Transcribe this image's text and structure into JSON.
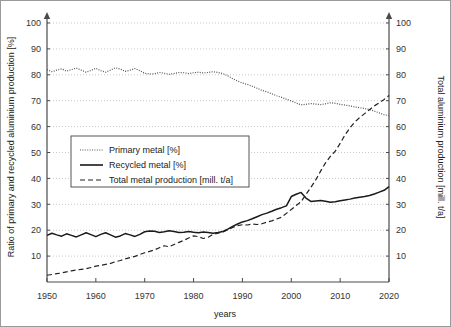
{
  "chart_data": {
    "type": "line",
    "title": "",
    "xlabel": "years",
    "ylabel_left": "Ratio of primary and recycled aluminium production [%]",
    "ylabel_right": "Total aluminium production [mill. t/a]",
    "xlim": [
      1950,
      2020
    ],
    "ylim_left": [
      0,
      100
    ],
    "ylim_right": [
      0,
      100
    ],
    "grid": true,
    "legend_position": "center-left",
    "xticks": [
      1950,
      1960,
      1970,
      1980,
      1990,
      2000,
      2010,
      2020
    ],
    "xtick_labels": [
      "1950",
      "1960",
      "1970",
      "1980",
      "1990",
      "2000",
      "2010",
      "2020"
    ],
    "yticks_left": [
      0,
      10,
      20,
      30,
      40,
      50,
      60,
      70,
      80,
      90,
      100
    ],
    "ytick_labels_left": [
      "",
      "10",
      "20",
      "30",
      "40",
      "50",
      "60",
      "70",
      "80",
      "90",
      "100"
    ],
    "yticks_right": [
      0,
      10,
      20,
      30,
      40,
      50,
      60,
      70,
      80,
      90,
      100
    ],
    "ytick_labels_right": [
      "",
      "10",
      "20",
      "30",
      "40",
      "50",
      "60",
      "70",
      "80",
      "90",
      "100"
    ],
    "x": [
      1950,
      1951,
      1952,
      1953,
      1954,
      1955,
      1956,
      1957,
      1958,
      1959,
      1960,
      1961,
      1962,
      1963,
      1964,
      1965,
      1966,
      1967,
      1968,
      1969,
      1970,
      1971,
      1972,
      1973,
      1974,
      1975,
      1976,
      1977,
      1978,
      1979,
      1980,
      1981,
      1982,
      1983,
      1984,
      1985,
      1986,
      1987,
      1988,
      1989,
      1990,
      1991,
      1992,
      1993,
      1994,
      1995,
      1996,
      1997,
      1998,
      1999,
      2000,
      2001,
      2002,
      2003,
      2004,
      2005,
      2006,
      2007,
      2008,
      2009,
      2010,
      2011,
      2012,
      2013,
      2014,
      2015,
      2016,
      2017,
      2018,
      2019,
      2020
    ],
    "series": [
      {
        "name": "Primary metal [%]",
        "axis": "left",
        "style": "dotted",
        "color": "#555555",
        "values": [
          82.0,
          81.2,
          81.8,
          82.3,
          81.4,
          82.0,
          82.6,
          81.8,
          81.0,
          81.7,
          82.5,
          81.6,
          81.0,
          81.8,
          82.7,
          82.2,
          81.3,
          81.8,
          82.4,
          81.6,
          80.6,
          80.3,
          80.4,
          80.9,
          80.6,
          80.2,
          80.5,
          80.9,
          80.8,
          80.5,
          80.8,
          81.0,
          80.7,
          80.9,
          81.2,
          80.9,
          80.5,
          79.6,
          78.5,
          77.6,
          76.8,
          76.3,
          75.6,
          74.8,
          74.0,
          73.4,
          72.7,
          71.9,
          71.3,
          70.6,
          69.9,
          69.1,
          68.4,
          68.6,
          68.9,
          68.7,
          68.5,
          68.8,
          69.2,
          69.0,
          68.6,
          68.3,
          68.0,
          67.6,
          67.3,
          67.0,
          66.6,
          66.0,
          65.3,
          64.6,
          64.2
        ]
      },
      {
        "name": "Recycled metal [%]",
        "axis": "left",
        "style": "solid",
        "color": "#1a1a1a",
        "values": [
          18.0,
          18.8,
          18.2,
          17.7,
          18.6,
          18.0,
          17.4,
          18.2,
          19.0,
          18.3,
          17.5,
          18.4,
          19.0,
          18.2,
          17.3,
          17.8,
          18.7,
          18.2,
          17.6,
          18.4,
          19.4,
          19.7,
          19.6,
          19.1,
          19.4,
          19.8,
          19.5,
          19.1,
          19.2,
          19.5,
          19.2,
          19.0,
          19.3,
          19.1,
          18.8,
          19.1,
          19.5,
          20.4,
          21.5,
          22.4,
          23.2,
          23.7,
          24.4,
          25.2,
          26.0,
          26.6,
          27.3,
          28.1,
          28.7,
          29.4,
          33.0,
          33.9,
          34.6,
          32.4,
          31.1,
          31.3,
          31.5,
          31.2,
          30.8,
          31.0,
          31.4,
          31.7,
          32.0,
          32.4,
          32.7,
          33.0,
          33.4,
          34.0,
          34.7,
          35.4,
          36.8
        ]
      },
      {
        "name": "Total metal production [mill. t/a]",
        "axis": "right",
        "style": "dashed",
        "color": "#222222",
        "values": [
          2.6,
          2.9,
          3.2,
          3.5,
          3.9,
          4.3,
          4.6,
          4.9,
          5.1,
          5.6,
          6.1,
          6.4,
          6.8,
          7.2,
          7.8,
          8.3,
          8.9,
          9.4,
          9.9,
          10.6,
          11.3,
          11.8,
          12.4,
          13.2,
          14.0,
          13.6,
          14.5,
          15.3,
          16.1,
          17.0,
          17.8,
          17.5,
          16.8,
          17.3,
          18.4,
          18.9,
          19.3,
          20.1,
          21.1,
          21.8,
          22.1,
          22.0,
          22.4,
          22.2,
          22.5,
          23.1,
          23.6,
          24.3,
          25.0,
          26.5,
          28.0,
          29.5,
          31.0,
          33.8,
          36.5,
          39.4,
          42.8,
          46.0,
          48.5,
          50.5,
          53.5,
          56.8,
          59.5,
          61.8,
          63.5,
          65.0,
          66.5,
          68.0,
          69.2,
          70.5,
          72.0
        ]
      }
    ],
    "legend_entries": [
      {
        "label": "Primary metal [%]",
        "style": "dotted"
      },
      {
        "label": "Recycled metal [%]",
        "style": "solid"
      },
      {
        "label": "Total metal production [mill. t/a]",
        "style": "dashed"
      }
    ]
  },
  "colors": {
    "grid": "#c9c9c9",
    "axis": "#4a4a4a",
    "frame": "#9a9a9a",
    "text": "#333333",
    "background": "#ffffff"
  }
}
